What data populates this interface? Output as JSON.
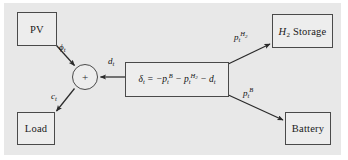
{
  "figure": {
    "type": "block-diagram",
    "background_color": "#e8e8e8",
    "page_color": "#ffffff",
    "node_fill_color": "#ededed",
    "node_border_color": "#4a4a4a",
    "arrow_color": "#2a2a2a"
  },
  "nodes": {
    "pv": {
      "label": "PV"
    },
    "load": {
      "label": "Load"
    },
    "h2_storage": {
      "label_part1": "H",
      "label_sub": "2",
      "label_part2": " Storage"
    },
    "battery": {
      "label": "Battery"
    },
    "sum": {
      "label": "+"
    },
    "equation": {
      "delta": "δ",
      "delta_sub": "t",
      "equals": " = −",
      "term1_base": "p",
      "term1_sub": "t",
      "term1_sup": "B",
      "minus1": " − ",
      "term2_base": "p",
      "term2_sub": "t",
      "term2_sup": "H",
      "term2_sup_sub": "2",
      "minus2": " − ",
      "term3_base": "d",
      "term3_sub": "t",
      "plain": "δt = −ptB − ptH2 − dt"
    }
  },
  "edges": [
    {
      "id": "pv-to-sum",
      "from": "pv",
      "to": "sum",
      "label_base": "ϕ",
      "label_sub": "t",
      "plain": "ϕt"
    },
    {
      "id": "sum-to-load",
      "from": "sum",
      "to": "load",
      "label_base": "c",
      "label_sub": "t",
      "plain": "ct"
    },
    {
      "id": "equation-to-sum",
      "from": "equation",
      "to": "sum",
      "label_base": "d",
      "label_sub": "t",
      "plain": "dt"
    },
    {
      "id": "equation-to-h2",
      "from": "equation",
      "to": "h2_storage",
      "label_base": "p",
      "label_sub": "t",
      "label_sup": "H",
      "label_sup_sub": "2",
      "plain": "ptH2"
    },
    {
      "id": "equation-to-battery",
      "from": "equation",
      "to": "battery",
      "label_base": "p",
      "label_sub": "t",
      "label_sup": "B",
      "plain": "ptB"
    }
  ]
}
